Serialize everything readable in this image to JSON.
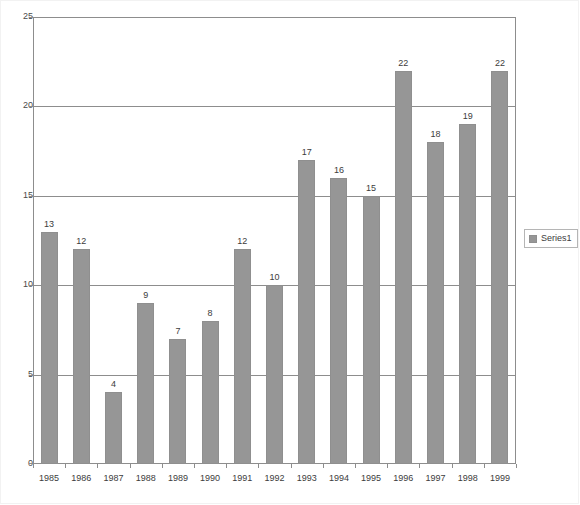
{
  "chart_data": {
    "type": "bar",
    "title": "",
    "subtitle": "",
    "xlabel": "",
    "ylabel": "",
    "categories": [
      "1985",
      "1986",
      "1987",
      "1988",
      "1989",
      "1990",
      "1991",
      "1992",
      "1993",
      "1994",
      "1995",
      "1996",
      "1997",
      "1998",
      "1999"
    ],
    "values": [
      13,
      12,
      4,
      9,
      7,
      8,
      12,
      10,
      17,
      16,
      15,
      22,
      18,
      19,
      22
    ],
    "series": [
      {
        "name": "Series1",
        "values": [
          13,
          12,
          4,
          9,
          7,
          8,
          12,
          10,
          17,
          16,
          15,
          22,
          18,
          19,
          22
        ],
        "color": "#969696"
      }
    ],
    "data_labels": [
      "13",
      "12",
      "4",
      "9",
      "7",
      "8",
      "12",
      "10",
      "17",
      "16",
      "15",
      "22",
      "18",
      "19",
      "22"
    ],
    "ylim": [
      0,
      25
    ],
    "y_ticks": [
      0,
      5,
      10,
      15,
      20,
      25
    ],
    "y_tick_labels": [
      "0",
      "5",
      "10",
      "15",
      "20",
      "25"
    ],
    "grid": {
      "horizontal": true,
      "vertical": false,
      "gridline_values": [
        5,
        10,
        15,
        20
      ]
    },
    "legend": {
      "position": "right",
      "entries": [
        {
          "label": "Series1",
          "color": "#969696"
        }
      ]
    },
    "colors": {
      "bar_fill": "#969696",
      "bar_border": "#8f8f8f",
      "axis": "#8d8d8d",
      "gridline": "#8d8d8d",
      "text": "#3c3c3c",
      "background": "#ffffff",
      "legend_border": "#b5b5b5"
    }
  },
  "legend": {
    "series1_label": "Series1"
  }
}
